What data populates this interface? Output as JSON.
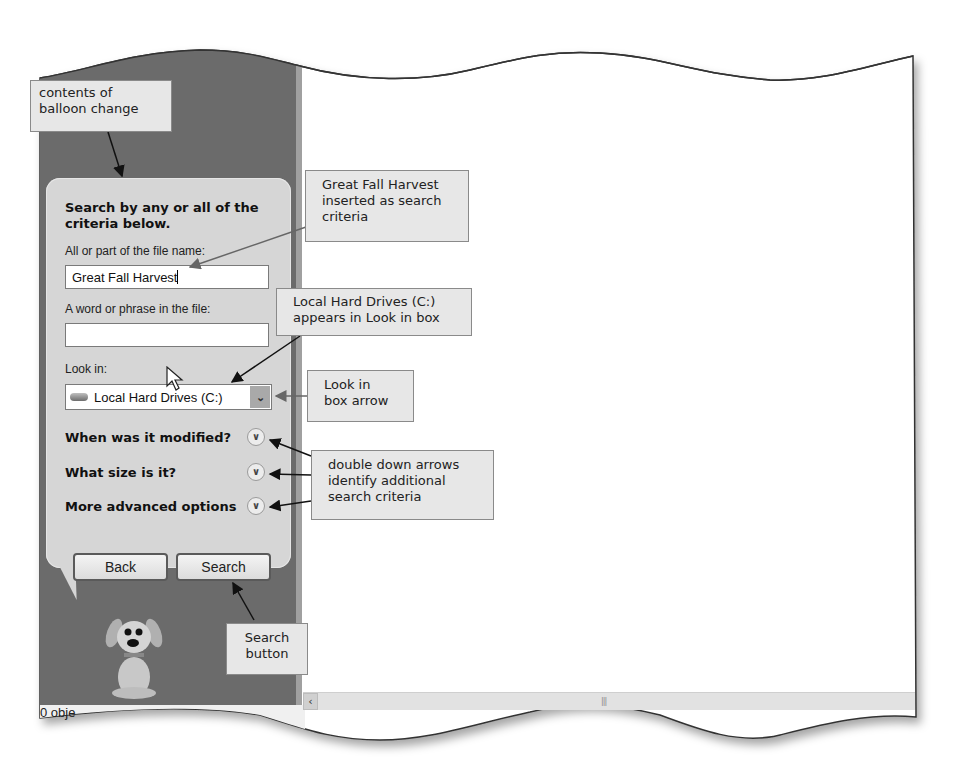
{
  "search_pane": {
    "heading": "Search by any or all of the criteria below.",
    "file_name_label": "All or part of the file name:",
    "file_name_value": "Great Fall Harvest",
    "phrase_label": "A word or phrase in the file:",
    "phrase_value": "",
    "look_in_label": "Look in:",
    "look_in_value": "Local Hard Drives (C:)",
    "options": [
      {
        "label": "When was it modified?",
        "icon": "double-chevron-down"
      },
      {
        "label": "What size is it?",
        "icon": "double-chevron-down"
      },
      {
        "label": "More advanced options",
        "icon": "double-chevron-down"
      }
    ],
    "back_label": "Back",
    "search_label": "Search"
  },
  "status_bar": {
    "text": "0 obje"
  },
  "scrollbar": {
    "left_arrow": "‹",
    "grip": "|||"
  },
  "callouts": {
    "balloon": "contents of balloon change",
    "inserted": "Great Fall Harvest inserted as search criteria",
    "look_in_box": "Local Hard Drives (C:) appears in Look in box",
    "look_in_arrow": "Look in box arrow",
    "double_arrows": "double down arrows identify additional search criteria",
    "search_button": "Search button"
  },
  "colors": {
    "pane_bg": "#6b6b6b",
    "balloon_bg": "#d6d6d6",
    "callout_bg": "#e7e7e7"
  }
}
